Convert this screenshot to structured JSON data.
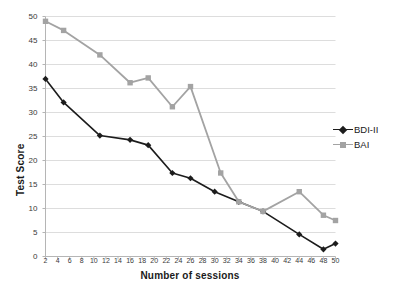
{
  "chart_data": {
    "type": "line",
    "title": "",
    "xlabel": "Number of sessions",
    "ylabel": "Test Score",
    "xlim": [
      2,
      50
    ],
    "ylim": [
      0,
      50
    ],
    "yticks": [
      0,
      5,
      10,
      15,
      20,
      25,
      30,
      35,
      40,
      45,
      50
    ],
    "xticks": [
      2,
      4,
      6,
      8,
      10,
      12,
      14,
      16,
      18,
      20,
      22,
      24,
      26,
      28,
      30,
      32,
      34,
      36,
      38,
      40,
      42,
      44,
      46,
      48,
      50
    ],
    "grid": true,
    "legend_position": "right",
    "series": [
      {
        "name": "BDI-II",
        "color": "#1c1c1c",
        "marker": "diamond",
        "x": [
          2,
          5,
          11,
          16,
          19,
          23,
          26,
          30,
          34,
          38,
          44,
          48,
          50
        ],
        "values": [
          37.0,
          32.1,
          25.2,
          24.3,
          23.2,
          17.4,
          16.3,
          13.5,
          11.4,
          9.4,
          4.6,
          1.5,
          2.7
        ]
      },
      {
        "name": "BAI",
        "color": "#a3a3a3",
        "marker": "square",
        "x": [
          2,
          5,
          11,
          16,
          19,
          23,
          26,
          31,
          34,
          38,
          44,
          48,
          50
        ],
        "values": [
          49.0,
          47.1,
          42.0,
          36.2,
          37.2,
          31.2,
          35.4,
          17.4,
          11.4,
          9.4,
          13.5,
          8.6,
          7.5
        ]
      }
    ]
  },
  "legend": {
    "entries": [
      {
        "label": "BDI-II"
      },
      {
        "label": "BAI"
      }
    ]
  },
  "colors": {
    "bdi": "#1c1c1c",
    "bai": "#a3a3a3",
    "grid": "#d9d9d9",
    "axis": "#b5b5b5",
    "text": "#1a1a1a"
  }
}
